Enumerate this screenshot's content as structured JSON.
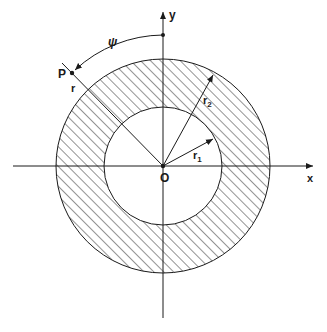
{
  "diagram": {
    "type": "annulus-coordinate-figure",
    "labels": {
      "x_axis": "x",
      "y_axis": "y",
      "origin": "O",
      "point": "P",
      "radius_r": "r",
      "angle": "ψ",
      "r1_base": "r",
      "r1_sub": "1",
      "r2_base": "r",
      "r2_sub": "2"
    },
    "colors": {
      "stroke": "#1a1a1a",
      "background": "#ffffff",
      "hatch": "#2a2a2a"
    },
    "geometry": {
      "origin": [
        163,
        166
      ],
      "outer_radius": 107,
      "inner_radius": 59,
      "point_P": [
        72,
        73
      ],
      "y_axis_marker": [
        163,
        35
      ]
    }
  }
}
